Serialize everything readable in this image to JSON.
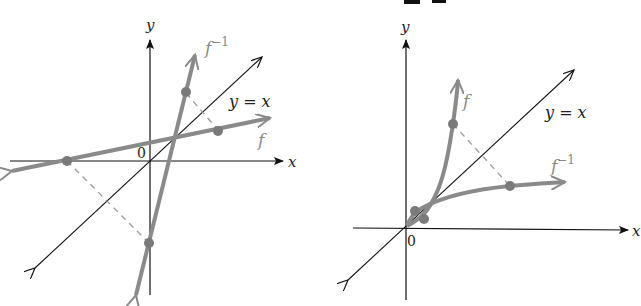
{
  "header": {
    "cut_off_title": "y = x"
  },
  "colors": {
    "axis": "#111111",
    "curve": "#8a8a8a",
    "dashed": "#9a9a9a",
    "point": "#7a7a7a",
    "text_dark": "#222222",
    "text_curve": "#8a8a8a"
  },
  "left_graph": {
    "x_axis_label": "x",
    "y_axis_label": "y",
    "origin_label": "0",
    "diagonal_label": "y = x",
    "f_label": "f",
    "finv_label": "f",
    "finv_superscript": "−1"
  },
  "right_graph": {
    "x_axis_label": "x",
    "y_axis_label": "y",
    "origin_label": "0",
    "diagonal_label": "y = x",
    "f_label": "f",
    "finv_label": "f",
    "finv_superscript": "−1"
  }
}
